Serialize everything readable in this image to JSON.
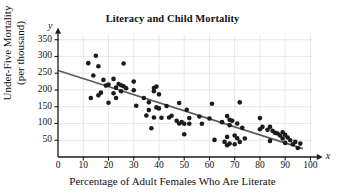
{
  "figure": {
    "title": "Literacy and Child Mortality",
    "x_axis_letter": "x",
    "y_axis_letter": "y"
  },
  "chart_data": {
    "type": "scatter",
    "title": "Literacy and Child Mortality",
    "xlabel": "Percentage of Adult Females Who Are Literate",
    "ylabel": "Under-Five Mortality (per thousand)",
    "ylabel_lines": [
      "Under-Five Mortality",
      "(per thousand)"
    ],
    "xlim": [
      0,
      103
    ],
    "ylim": [
      0,
      370
    ],
    "xticks": [
      0,
      10,
      20,
      30,
      40,
      50,
      60,
      70,
      80,
      90,
      100
    ],
    "yticks": [
      50,
      100,
      150,
      200,
      250,
      300,
      350
    ],
    "grid": true,
    "legend": "none",
    "point_color": "#1b1b1b",
    "trend_color": "#5a5a5a",
    "grid_color": "#d9d9e0",
    "axis_color": "#1a1a1a",
    "trend_line": {
      "x": [
        0,
        97
      ],
      "y": [
        258,
        25
      ]
    },
    "points": [
      [
        12,
        280
      ],
      [
        13,
        176
      ],
      [
        14,
        243
      ],
      [
        15,
        302
      ],
      [
        16,
        271
      ],
      [
        16,
        184
      ],
      [
        17,
        192
      ],
      [
        18,
        230
      ],
      [
        19,
        213
      ],
      [
        20,
        216
      ],
      [
        20,
        162
      ],
      [
        22,
        233
      ],
      [
        22,
        190
      ],
      [
        23,
        207
      ],
      [
        23,
        176
      ],
      [
        24,
        218
      ],
      [
        25,
        214
      ],
      [
        25,
        196
      ],
      [
        26,
        279
      ],
      [
        26,
        211
      ],
      [
        27,
        205
      ],
      [
        30,
        225
      ],
      [
        30,
        199
      ],
      [
        31,
        153
      ],
      [
        34,
        176
      ],
      [
        35,
        124
      ],
      [
        36,
        163
      ],
      [
        36,
        140
      ],
      [
        37,
        86
      ],
      [
        38,
        206
      ],
      [
        38,
        196
      ],
      [
        38,
        118
      ],
      [
        39,
        210
      ],
      [
        39,
        148
      ],
      [
        40,
        187
      ],
      [
        40,
        145
      ],
      [
        41,
        117
      ],
      [
        43,
        152
      ],
      [
        44,
        118
      ],
      [
        45,
        123
      ],
      [
        47,
        108
      ],
      [
        48,
        100
      ],
      [
        48,
        161
      ],
      [
        49,
        104
      ],
      [
        50,
        99
      ],
      [
        50,
        68
      ],
      [
        51,
        141
      ],
      [
        52,
        116
      ],
      [
        52,
        99
      ],
      [
        56,
        121
      ],
      [
        57,
        99
      ],
      [
        60,
        115
      ],
      [
        61,
        159
      ],
      [
        62,
        51
      ],
      [
        65,
        104
      ],
      [
        66,
        45
      ],
      [
        67,
        122
      ],
      [
        67,
        60
      ],
      [
        67,
        35
      ],
      [
        68,
        111
      ],
      [
        68,
        95
      ],
      [
        68,
        40
      ],
      [
        69,
        108
      ],
      [
        70,
        64
      ],
      [
        70,
        38
      ],
      [
        71,
        100
      ],
      [
        71,
        56
      ],
      [
        72,
        163
      ],
      [
        72,
        45
      ],
      [
        73,
        87
      ],
      [
        74,
        55
      ],
      [
        80,
        116
      ],
      [
        80,
        83
      ],
      [
        81,
        90
      ],
      [
        83,
        81
      ],
      [
        84,
        90
      ],
      [
        84,
        48
      ],
      [
        85,
        78
      ],
      [
        86,
        72
      ],
      [
        87,
        70
      ],
      [
        88,
        64
      ],
      [
        89,
        74
      ],
      [
        89,
        55
      ],
      [
        90,
        66
      ],
      [
        90,
        42
      ],
      [
        91,
        58
      ],
      [
        92,
        50
      ],
      [
        93,
        38
      ],
      [
        94,
        45
      ],
      [
        95,
        27
      ],
      [
        96,
        40
      ]
    ]
  }
}
